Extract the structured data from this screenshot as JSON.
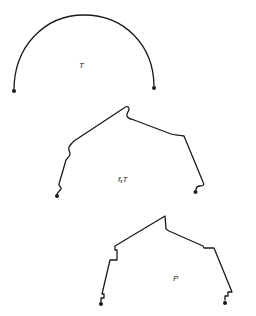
{
  "figure": {
    "colors": {
      "stroke": "#1a1a1a",
      "background": "#ffffff",
      "label": "#222222"
    },
    "curves": [
      {
        "id": "T",
        "label": "T",
        "label_main": "T",
        "label_sub": "",
        "type": "semicircle-arc",
        "start_point": [
          14,
          90
        ],
        "end_point": [
          154,
          87
        ],
        "apex": [
          85,
          15
        ],
        "label_pos": [
          79,
          62
        ]
      },
      {
        "id": "f_eps_T",
        "label": "f_εT",
        "label_main_prefix": "f",
        "label_sub": "ε",
        "label_main_suffix": "T",
        "type": "perturbed-polyline",
        "start_point": [
          57,
          195
        ],
        "end_point": [
          195,
          192
        ],
        "label_pos": [
          118,
          176
        ]
      },
      {
        "id": "P",
        "label": "P",
        "label_main": "P",
        "label_sub": "",
        "type": "polygonal-path",
        "start_point": [
          101,
          304
        ],
        "end_point": [
          226,
          303
        ],
        "label_pos": [
          173,
          275
        ]
      }
    ]
  }
}
